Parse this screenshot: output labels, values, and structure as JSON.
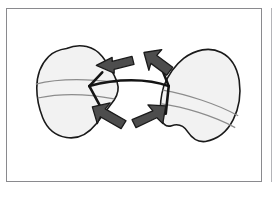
{
  "figure": {
    "caption": "",
    "panel_label": "",
    "background_color": "#ffffff",
    "frame_color": "#8a8a8e",
    "adjacent_panel_edge_color": "#b4b4b8"
  },
  "diagram": {
    "title": "",
    "type": "anatomical-line-drawing",
    "outline_color": "#1a1a1a",
    "body_fill_color": "#f2f2f2",
    "vein_color": "#8c8c8c",
    "hinge_color": "#141414",
    "arrow_fill_color": "#4d4d4d",
    "arrow_outline_color": "#1a1a1a",
    "shapes": [
      {
        "name": "left-valve",
        "label": "",
        "fill": "#f2f2f2",
        "stroke": "#1a1a1a"
      },
      {
        "name": "right-valve",
        "label": "",
        "fill": "#f2f2f2",
        "stroke": "#1a1a1a"
      },
      {
        "name": "hinge-connector",
        "label": "",
        "stroke": "#141414"
      }
    ],
    "arrows": [
      {
        "name": "arrow-upper-left",
        "direction": "left",
        "label": ""
      },
      {
        "name": "arrow-upper-right",
        "direction": "down-right",
        "label": ""
      },
      {
        "name": "arrow-lower-left",
        "direction": "up-left",
        "label": ""
      },
      {
        "name": "arrow-lower-right",
        "direction": "up-right",
        "label": ""
      }
    ]
  }
}
